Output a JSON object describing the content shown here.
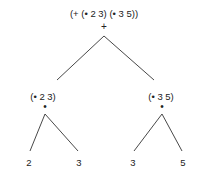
{
  "tree": {
    "root": {
      "expression": "(+ (• 2 3) (• 3 5))",
      "operator": "+"
    },
    "left": {
      "expression": "(• 2 3)",
      "operator": "•",
      "leaves": [
        "2",
        "3"
      ]
    },
    "right": {
      "expression": "(• 3 5)",
      "operator": "•",
      "leaves": [
        "3",
        "5"
      ]
    }
  }
}
